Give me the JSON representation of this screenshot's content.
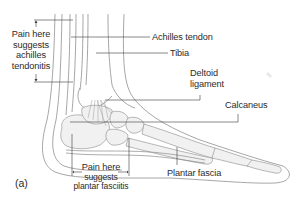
{
  "figure": {
    "panel_label": "(a)",
    "labels": {
      "achilles_pain": [
        "Pain here",
        "suggests",
        "achilles",
        "tendonitis"
      ],
      "achilles_tendon": "Achilles tendon",
      "tibia": "Tibia",
      "deltoid_ligament": [
        "Deltoid",
        "ligament"
      ],
      "calcaneus": "Calcaneus",
      "plantar_pain": [
        "Pain here",
        "suggests",
        "plantar fasciitis"
      ],
      "plantar_fascia": "Plantar fascia"
    },
    "colors": {
      "outline": "#8a8a8a",
      "leader_line": "#3a3a3a",
      "bone_fill": "#efefef",
      "text": "#2b2b2b"
    }
  }
}
